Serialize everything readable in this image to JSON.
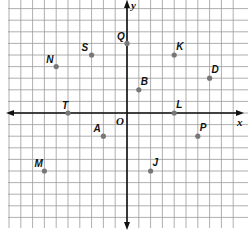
{
  "chart_data": {
    "type": "scatter",
    "title": "",
    "xlabel": "x",
    "ylabel": "y",
    "origin_label": "O",
    "grid": true,
    "xlim": [
      -10,
      10
    ],
    "ylim": [
      -10,
      9
    ],
    "points": [
      {
        "label": "Q",
        "x": 0,
        "y": 6
      },
      {
        "label": "S",
        "x": -3,
        "y": 5
      },
      {
        "label": "K",
        "x": 4,
        "y": 5
      },
      {
        "label": "N",
        "x": -6,
        "y": 4
      },
      {
        "label": "D",
        "x": 7,
        "y": 3
      },
      {
        "label": "B",
        "x": 1,
        "y": 2
      },
      {
        "label": "T",
        "x": -5,
        "y": 0
      },
      {
        "label": "L",
        "x": 4,
        "y": 0
      },
      {
        "label": "A",
        "x": -2,
        "y": -2
      },
      {
        "label": "P",
        "x": 6,
        "y": -2
      },
      {
        "label": "J",
        "x": 2,
        "y": -5
      },
      {
        "label": "M",
        "x": -7,
        "y": -5
      }
    ]
  },
  "style": {
    "grid_color": "#9a9a9a",
    "axis_color": "#111111",
    "point_color": "#777777"
  }
}
